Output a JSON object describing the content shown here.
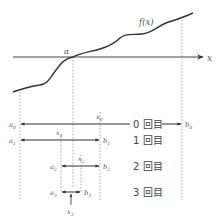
{
  "diagram": {
    "axis": {
      "label": "x"
    },
    "curve": {
      "label": "f(x)"
    },
    "root": {
      "label": "α"
    },
    "iterations": [
      {
        "index": "0",
        "label": "0 回目",
        "a": "a",
        "a_sub": "0",
        "b": "b",
        "b_sub": "0",
        "mid": "x",
        "mid_sub": "0"
      },
      {
        "index": "1",
        "label": "1 回目",
        "a": "a",
        "a_sub": "1",
        "b": "b",
        "b_sub": "1",
        "mid": "x",
        "mid_sub": "1"
      },
      {
        "index": "2",
        "label": "2 回目",
        "a": "a",
        "a_sub": "2",
        "b": "b",
        "b_sub": "2",
        "mid": "x",
        "mid_sub": "2"
      },
      {
        "index": "3",
        "label": "3 回目",
        "a": "a",
        "a_sub": "3",
        "b": "b",
        "b_sub": "3",
        "mid": "x",
        "mid_sub": "3"
      }
    ],
    "colors": {
      "line": "#444444",
      "dashed": "#999999",
      "text": "#555555"
    }
  }
}
